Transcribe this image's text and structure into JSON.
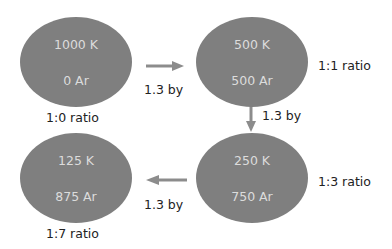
{
  "colors": {
    "node_fill": "#7f7f7f",
    "node_text": "#dcdcdc",
    "arrow": "#8c8c8c",
    "label": "#222222"
  },
  "nodes": [
    {
      "id": "n1",
      "top": "1000 K",
      "bottom": "0 Ar",
      "ratio": "1:0 ratio"
    },
    {
      "id": "n2",
      "top": "500 K",
      "bottom": "500 Ar",
      "ratio": "1:1 ratio"
    },
    {
      "id": "n3",
      "top": "250 K",
      "bottom": "750 Ar",
      "ratio": "1:3 ratio"
    },
    {
      "id": "n4",
      "top": "125 K",
      "bottom": "875 Ar",
      "ratio": "1:7 ratio"
    }
  ],
  "edges": [
    {
      "from": "n1",
      "to": "n2",
      "label": "1.3 by",
      "direction": "right"
    },
    {
      "from": "n2",
      "to": "n3",
      "label": "1.3 by",
      "direction": "down"
    },
    {
      "from": "n3",
      "to": "n4",
      "label": "1.3 by",
      "direction": "left"
    }
  ]
}
